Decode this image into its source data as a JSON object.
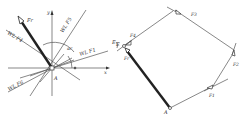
{
  "left_figure": {
    "origin_label": "A",
    "x_axis_label": "x",
    "y_axis_label": "y",
    "resultant_label": "Fr",
    "angle_label": "αr",
    "lines": [
      {
        "label": "WL F5"
      },
      {
        "label": "WL F4"
      },
      {
        "label": "WL F1"
      },
      {
        "label": "WL F6"
      }
    ],
    "side_label": "E"
  },
  "right_figure": {
    "start_label": "A",
    "end_label": "E",
    "forces": [
      "F1",
      "F2",
      "F3",
      "F4",
      "Fr"
    ]
  },
  "colors": {
    "line": "#555555",
    "thick": "#222222",
    "background": "#ffffff"
  }
}
